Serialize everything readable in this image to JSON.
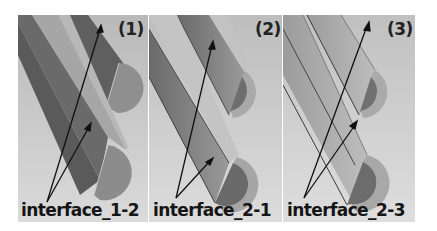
{
  "figure": {
    "background": "#ffffff",
    "panels": [
      {
        "id": "1",
        "label": "(1)",
        "interface_label": "interface_1-2",
        "style": "solid half-cylinders",
        "colors": {
          "bg": "#c4c4c4",
          "dark_face": "#5e5e5e",
          "light_face": "#aaaaaa",
          "cap": "#8a8a8a"
        }
      },
      {
        "id": "2",
        "label": "(2)",
        "interface_label": "interface_2-1",
        "style": "hollow half-cylinders (shells)",
        "colors": {
          "bg": "#c8c8c8",
          "shell_outer": "#b5b5b5",
          "inner": "#7a7a7a",
          "rim": "#a8a8a8"
        }
      },
      {
        "id": "3",
        "label": "(3)",
        "interface_label": "interface_2-3",
        "style": "hollow half-cylinders (shells)",
        "colors": {
          "bg": "#cacaca",
          "shell_outer": "#b8b8b8",
          "inner": "#7c7c7c",
          "rim": "#ababab"
        }
      }
    ],
    "arrow_color": "#111111"
  }
}
